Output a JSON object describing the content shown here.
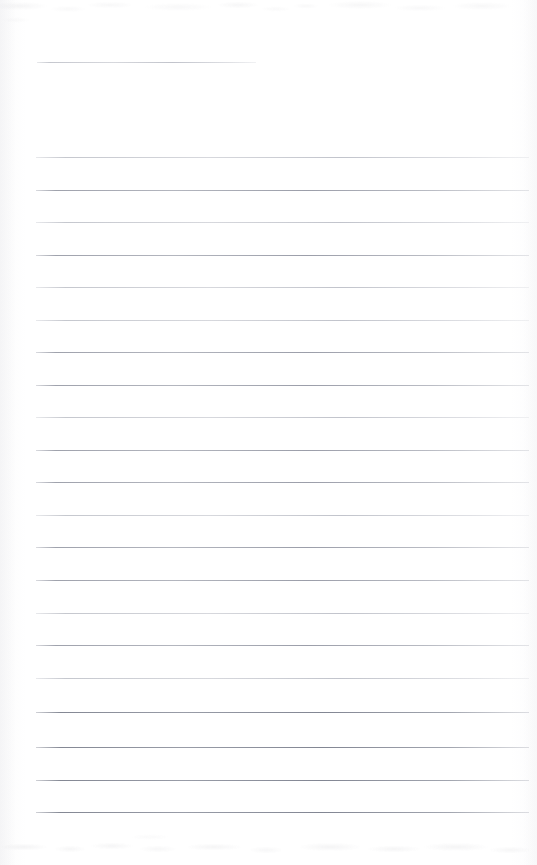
{
  "document": {
    "type": "scanned-lined-paper",
    "title": "Blank ruled notepaper scan",
    "page_width": 537,
    "page_height": 865,
    "background_color": "#ffffff",
    "rule_color": "#9a9da8",
    "rule_color_faint": "#b4b7c0",
    "rule_color_strong": "#84889 4",
    "content_text": "",
    "visible_text_lines": [],
    "notes": "Page is empty — no handwriting, no printed text, no headers, no page numbers."
  },
  "rules": [
    {
      "name": "header-rule",
      "y": 62,
      "x": 37,
      "width": 219,
      "weight": "faint"
    },
    {
      "name": "body-rule-1",
      "y": 157,
      "x": 36,
      "width": 493,
      "weight": "faint"
    },
    {
      "name": "body-rule-2",
      "y": 190,
      "x": 36,
      "width": 493,
      "weight": "normal"
    },
    {
      "name": "body-rule-3",
      "y": 222,
      "x": 36,
      "width": 493,
      "weight": "faint"
    },
    {
      "name": "body-rule-4",
      "y": 255,
      "x": 36,
      "width": 493,
      "weight": "normal"
    },
    {
      "name": "body-rule-5",
      "y": 287,
      "x": 36,
      "width": 493,
      "weight": "faint"
    },
    {
      "name": "body-rule-6",
      "y": 320,
      "x": 36,
      "width": 493,
      "weight": "faint"
    },
    {
      "name": "body-rule-7",
      "y": 352,
      "x": 36,
      "width": 493,
      "weight": "normal"
    },
    {
      "name": "body-rule-8",
      "y": 385,
      "x": 36,
      "width": 493,
      "weight": "normal"
    },
    {
      "name": "body-rule-9",
      "y": 417,
      "x": 36,
      "width": 493,
      "weight": "faint"
    },
    {
      "name": "body-rule-10",
      "y": 450,
      "x": 36,
      "width": 493,
      "weight": "normal"
    },
    {
      "name": "body-rule-11",
      "y": 482,
      "x": 36,
      "width": 493,
      "weight": "normal"
    },
    {
      "name": "body-rule-12",
      "y": 515,
      "x": 36,
      "width": 493,
      "weight": "faint"
    },
    {
      "name": "body-rule-13",
      "y": 547,
      "x": 36,
      "width": 493,
      "weight": "normal"
    },
    {
      "name": "body-rule-14",
      "y": 580,
      "x": 36,
      "width": 493,
      "weight": "normal"
    },
    {
      "name": "body-rule-15",
      "y": 613,
      "x": 36,
      "width": 493,
      "weight": "faint"
    },
    {
      "name": "body-rule-16",
      "y": 645,
      "x": 36,
      "width": 493,
      "weight": "normal"
    },
    {
      "name": "body-rule-17",
      "y": 678,
      "x": 36,
      "width": 493,
      "weight": "faint"
    },
    {
      "name": "body-rule-18",
      "y": 712,
      "x": 36,
      "width": 493,
      "weight": "strong"
    },
    {
      "name": "body-rule-19",
      "y": 747,
      "x": 36,
      "width": 493,
      "weight": "strong"
    },
    {
      "name": "body-rule-20",
      "y": 780,
      "x": 36,
      "width": 493,
      "weight": "strong"
    },
    {
      "name": "body-rule-21",
      "y": 812,
      "x": 36,
      "width": 493,
      "weight": "strong"
    }
  ],
  "artifacts": {
    "top_noise_label": "scanner-noise-band-top",
    "bottom_noise_label": "scanner-bleedthrough-band-bottom",
    "left_edge_label": "scan-edge-shadow-left",
    "right_edge_label": "scan-edge-shadow-right"
  }
}
